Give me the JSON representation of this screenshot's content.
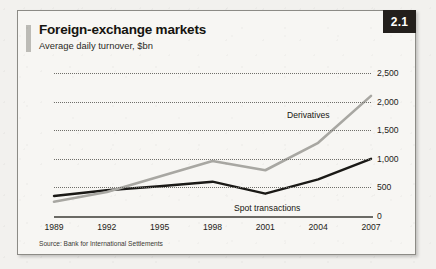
{
  "figure": {
    "title": "Foreign-exchange markets",
    "subtitle": "Average daily turnover, $bn",
    "badge": "2.1",
    "source": "Source: Bank for International Settlements"
  },
  "chart_data": {
    "type": "line",
    "title": "Foreign-exchange markets",
    "subtitle": "Average daily turnover, $bn",
    "xlabel": "",
    "ylabel": "$bn",
    "categories": [
      "1989",
      "1992",
      "1995",
      "1998",
      "2001",
      "2004",
      "2007"
    ],
    "ylim": [
      0,
      2500
    ],
    "yticks": [
      0,
      500,
      1000,
      1500,
      2000,
      2500
    ],
    "ytick_labels": [
      "0",
      "500",
      "1,000",
      "1,500",
      "2,000",
      "2,500"
    ],
    "grid": true,
    "legend_position": "inline-annotations",
    "series": [
      {
        "name": "Derivatives",
        "color": "#a8a7a2",
        "values": [
          250,
          420,
          690,
          960,
          800,
          1280,
          2100
        ],
        "label_position": {
          "x": 269,
          "y": 99
        }
      },
      {
        "name": "Spot transactions",
        "color": "#1a1916",
        "values": [
          350,
          450,
          520,
          600,
          390,
          640,
          1000
        ],
        "label_position": {
          "x": 216,
          "y": 192
        }
      }
    ],
    "annotations": [
      "Derivatives",
      "Spot transactions"
    ]
  }
}
